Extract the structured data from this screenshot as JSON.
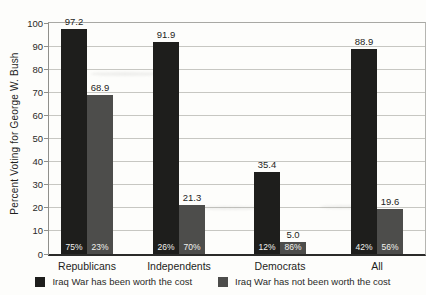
{
  "chart_data": {
    "type": "bar",
    "title": "",
    "ylabel": "Percent Voting for George W. Bush",
    "xlabel": "",
    "ylim": [
      0,
      100
    ],
    "yticks": [
      0,
      10,
      20,
      30,
      40,
      50,
      60,
      70,
      80,
      90,
      100
    ],
    "grid": true,
    "legend_position": "bottom",
    "categories": [
      "Republicans",
      "Independents",
      "Democrats",
      "All"
    ],
    "series": [
      {
        "name": "Iraq War has been worth the cost",
        "color": "#1e1e1c",
        "values": [
          97.2,
          91.9,
          35.4,
          88.9
        ],
        "value_labels": [
          "97.2",
          "91.9",
          "35.4",
          "88.9"
        ],
        "inside_labels": [
          "75%",
          "26%",
          "12%",
          "42%"
        ]
      },
      {
        "name": "Iraq War has not been worth the cost",
        "color": "#4d4d4b",
        "values": [
          68.9,
          21.3,
          5.0,
          19.6
        ],
        "value_labels": [
          "68.9",
          "21.3",
          "5.0",
          "19.6"
        ],
        "inside_labels": [
          "23%",
          "70%",
          "86%",
          "56%"
        ]
      }
    ]
  }
}
